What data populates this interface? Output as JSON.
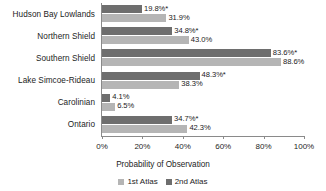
{
  "chart_data": {
    "type": "bar",
    "orientation": "horizontal",
    "title": "",
    "xlabel": "Probability of Observation",
    "ylabel": "",
    "xlim": [
      0,
      100
    ],
    "xtick_labels": [
      "0%",
      "20%",
      "40%",
      "60%",
      "80%",
      "100%"
    ],
    "xticks": [
      0,
      20,
      40,
      60,
      80,
      100
    ],
    "grid": false,
    "legend_position": "bottom",
    "categories": [
      "Hudson Bay Lowlands",
      "Northern Shield",
      "Southern Shield",
      "Lake Simcoe-Rideau",
      "Carolinian",
      "Ontario"
    ],
    "series": [
      {
        "name": "2nd Atlas",
        "color": "#6e6e6e",
        "values": [
          19.8,
          34.8,
          83.6,
          48.3,
          4.1,
          34.7
        ],
        "labels": [
          "19.8%*",
          "34.8%*",
          "83.6%*",
          "48.3%*",
          "4.1%",
          "34.7%*"
        ]
      },
      {
        "name": "1st Atlas",
        "color": "#b5b5b5",
        "values": [
          31.9,
          43.0,
          88.6,
          38.3,
          6.5,
          42.3
        ],
        "labels": [
          "31.9%",
          "43.0%",
          "88.6%",
          "38.3%",
          "6.5%",
          "42.3%"
        ]
      }
    ],
    "legend": [
      {
        "label": "1st Atlas",
        "color": "#b5b5b5"
      },
      {
        "label": "2nd Atlas",
        "color": "#6e6e6e"
      }
    ]
  }
}
